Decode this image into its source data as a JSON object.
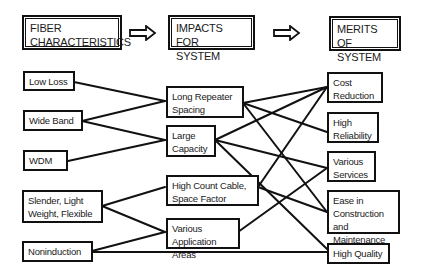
{
  "headers": [
    {
      "id": "fiber",
      "label": "FIBER\nCHARACTERISTICS"
    },
    {
      "id": "impacts",
      "label": "IMPACTS FOR\nSYSTEM"
    },
    {
      "id": "merits",
      "label": "MERITS OF\nSYSTEM"
    }
  ],
  "header_arrows": [
    "right-arrow",
    "right-arrow"
  ],
  "characteristics": [
    {
      "id": "low-loss",
      "label": "Low Loss"
    },
    {
      "id": "wide-band",
      "label": "Wide Band"
    },
    {
      "id": "wdm",
      "label": "WDM"
    },
    {
      "id": "slender",
      "label": "Slender, Light\nWeight, Flexible"
    },
    {
      "id": "noninduction",
      "label": "Noninduction"
    }
  ],
  "impacts": [
    {
      "id": "long-repeater",
      "label": "Long Repeater\nSpacing"
    },
    {
      "id": "large-capacity",
      "label": "Large\nCapacity"
    },
    {
      "id": "high-count",
      "label": "High Count Cable,\nSpace Factor"
    },
    {
      "id": "various-app",
      "label": "Various\nApplication Areas"
    }
  ],
  "merits": [
    {
      "id": "cost-reduction",
      "label": "Cost\nReduction"
    },
    {
      "id": "high-reliability",
      "label": "High\nReliability"
    },
    {
      "id": "various-services",
      "label": "Various\nServices"
    },
    {
      "id": "ease-construction",
      "label": "Ease in\nConstruction\nand Maintenance"
    },
    {
      "id": "high-quality",
      "label": "High Quality"
    }
  ],
  "connections": [
    [
      "Low Loss",
      "Long Repeater Spacing"
    ],
    [
      "Wide Band",
      "Long Repeater Spacing"
    ],
    [
      "Wide Band",
      "Large Capacity"
    ],
    [
      "WDM",
      "Large Capacity"
    ],
    [
      "Slender, Light Weight, Flexible",
      "High Count Cable, Space Factor"
    ],
    [
      "Slender, Light Weight, Flexible",
      "Various Application Areas"
    ],
    [
      "Noninduction",
      "Various Application Areas"
    ],
    [
      "Noninduction",
      "High Quality"
    ],
    [
      "Long Repeater Spacing",
      "Cost Reduction"
    ],
    [
      "Long Repeater Spacing",
      "High Reliability"
    ],
    [
      "Long Repeater Spacing",
      "Ease in Construction and Maintenance"
    ],
    [
      "Large Capacity",
      "Cost Reduction"
    ],
    [
      "Large Capacity",
      "Various Services"
    ],
    [
      "Large Capacity",
      "High Quality"
    ],
    [
      "High Count Cable, Space Factor",
      "Cost Reduction"
    ],
    [
      "High Count Cable, Space Factor",
      "Ease in Construction and Maintenance"
    ],
    [
      "Various Application Areas",
      "Various Services"
    ]
  ]
}
